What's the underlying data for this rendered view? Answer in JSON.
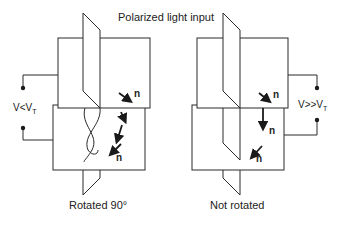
{
  "title": "Polarized light input",
  "left_panel": {
    "voltage_label": "V<V",
    "voltage_subscript": "T",
    "caption": "Rotated 90°",
    "director_labels": [
      "n",
      "n"
    ]
  },
  "right_panel": {
    "voltage_label": "V>>V",
    "voltage_subscript": "T",
    "caption": "Not rotated",
    "director_labels": [
      "n",
      "n",
      "n"
    ]
  },
  "colors": {
    "stroke": "#2a2a2a",
    "background": "#ffffff"
  }
}
